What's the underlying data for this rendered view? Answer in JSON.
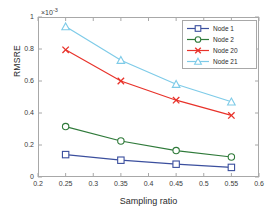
{
  "chart_data": {
    "type": "line",
    "title": "",
    "subtitle": "",
    "xlabel": "Sampling ratio",
    "ylabel": "RMSRE",
    "y_exponent_label": "10",
    "y_exponent_power": "-3",
    "y_exponent_prefix": "×",
    "x": [
      0.25,
      0.35,
      0.45,
      0.55
    ],
    "xlim": [
      0.2,
      0.6
    ],
    "ylim": [
      0,
      1
    ],
    "xticks": [
      "0.2",
      "0.25",
      "0.3",
      "0.35",
      "0.4",
      "0.45",
      "0.5",
      "0.55",
      "0.6"
    ],
    "xtick_values": [
      0.2,
      0.25,
      0.3,
      0.35,
      0.4,
      0.45,
      0.5,
      0.55,
      0.6
    ],
    "yticks": [
      "0",
      "0.2",
      "0.4",
      "0.6",
      "0.8",
      "1"
    ],
    "ytick_values": [
      0,
      0.2,
      0.4,
      0.6,
      0.8,
      1
    ],
    "grid": false,
    "legend_position": "top-right",
    "series": [
      {
        "name": "Node 1",
        "values": [
          0.14,
          0.105,
          0.08,
          0.06
        ],
        "color": "#3b4f9e",
        "marker": "square"
      },
      {
        "name": "Node 2",
        "values": [
          0.315,
          0.225,
          0.165,
          0.125
        ],
        "color": "#2f7a3a",
        "marker": "circle"
      },
      {
        "name": "Node 20",
        "values": [
          0.795,
          0.6,
          0.48,
          0.385
        ],
        "color": "#e8322a",
        "marker": "cross"
      },
      {
        "name": "Node 21",
        "values": [
          0.94,
          0.73,
          0.58,
          0.47
        ],
        "color": "#7ecbe8",
        "marker": "triangle"
      }
    ]
  },
  "legend": {
    "entries": [
      {
        "label": "Node 1"
      },
      {
        "label": "Node 2"
      },
      {
        "label": "Node 20"
      },
      {
        "label": "Node 21"
      }
    ]
  },
  "axes": {
    "x_label": "Sampling ratio",
    "y_label": "RMSRE"
  },
  "colors": {
    "node1": "#3b4f9e",
    "node2": "#2f7a3a",
    "node20": "#e8322a",
    "node21": "#7ecbe8",
    "axis": "#a8a8a8",
    "text": "#2b2b2b"
  }
}
